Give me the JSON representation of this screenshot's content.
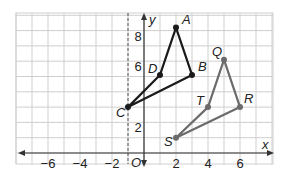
{
  "figure": {
    "x_axis_label": "x",
    "y_axis_label": "y",
    "origin_label": "O",
    "x_ticks": [
      {
        "value": -6,
        "label": "−6"
      },
      {
        "value": -4,
        "label": "−4"
      },
      {
        "value": -2,
        "label": "−2"
      },
      {
        "value": 2,
        "label": "2"
      },
      {
        "value": 4,
        "label": "4"
      },
      {
        "value": 6,
        "label": "6"
      }
    ],
    "y_ticks": [
      {
        "value": 2,
        "label": "2"
      },
      {
        "value": 6,
        "label": "6"
      },
      {
        "value": 8,
        "label": "8"
      }
    ],
    "dashed_line": {
      "x": -1
    },
    "colors": {
      "grid": "#cfcfcf",
      "axis": "#333333",
      "quad_abcd": "#1a1a1a",
      "quad_qrst": "#6b6b6b"
    },
    "quadrilaterals": [
      {
        "name": "ABCD",
        "vertices": [
          {
            "label": "A",
            "x": 2,
            "y": 8.2
          },
          {
            "label": "B",
            "x": 3,
            "y": 5.1
          },
          {
            "label": "C",
            "x": -1,
            "y": 3
          },
          {
            "label": "D",
            "x": 1,
            "y": 5.1
          }
        ]
      },
      {
        "name": "QRST",
        "vertices": [
          {
            "label": "Q",
            "x": 5,
            "y": 6.1
          },
          {
            "label": "R",
            "x": 6,
            "y": 3
          },
          {
            "label": "S",
            "x": 2,
            "y": 1
          },
          {
            "label": "T",
            "x": 4,
            "y": 3
          }
        ]
      }
    ]
  }
}
